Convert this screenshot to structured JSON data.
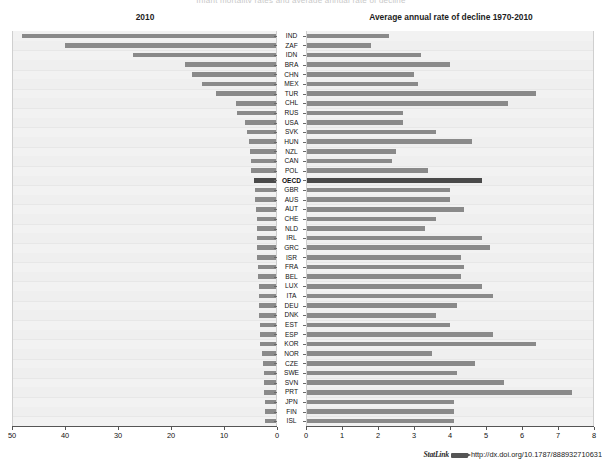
{
  "supertitle": "Infant mortality rates and average annual rate of decline",
  "panels": {
    "left": {
      "title": "2010",
      "axis_min": 0,
      "axis_max": 50,
      "reversed": true,
      "ticks": [
        50,
        40,
        30,
        20,
        10,
        0
      ]
    },
    "right": {
      "title": "Average  annual rate of decline 1970-2010",
      "axis_min": 0,
      "axis_max": 8,
      "reversed": false,
      "ticks": [
        0,
        1,
        2,
        3,
        4,
        5,
        6,
        7,
        8
      ]
    }
  },
  "highlight": {
    "category": "OECD",
    "color": "#4a4a4a"
  },
  "colors": {
    "bar": "#8a8a8a",
    "bar_highlight": "#4a4a4a",
    "plot_bg": "#f2f2f2",
    "grid": "#e7e7e7",
    "axis": "#555555"
  },
  "footer": {
    "statlink_label": "StatLink",
    "url": "http://dx.doi.org/10.1787/888932710631"
  },
  "chart_data": {
    "type": "bar",
    "title": "Infant mortality rates and average annual rate of decline",
    "orientation": "horizontal",
    "layout": "back-to-back dual panel (tornado)",
    "categories": [
      "IND",
      "ZAF",
      "IDN",
      "BRA",
      "CHN",
      "MEX",
      "TUR",
      "CHL",
      "RUS",
      "USA",
      "SVK",
      "HUN",
      "NZL",
      "CAN",
      "POL",
      "OECD",
      "GBR",
      "AUS",
      "AUT",
      "CHE",
      "NLD",
      "IRL",
      "GRC",
      "ISR",
      "FRA",
      "BEL",
      "LUX",
      "ITA",
      "DEU",
      "DNK",
      "EST",
      "ESP",
      "KOR",
      "NOR",
      "CZE",
      "SWE",
      "SVN",
      "PRT",
      "JPN",
      "FIN",
      "ISL"
    ],
    "series": [
      {
        "name": "2010",
        "panel": "left",
        "xlabel": "",
        "ylabel": "",
        "xlim": [
          50,
          0
        ],
        "values": [
          48.2,
          40.0,
          27.2,
          17.3,
          16.0,
          14.1,
          11.6,
          7.8,
          7.5,
          6.1,
          5.7,
          5.3,
          5.1,
          5.0,
          5.0,
          4.3,
          4.2,
          4.1,
          3.9,
          3.8,
          3.8,
          3.8,
          3.8,
          3.7,
          3.6,
          3.6,
          3.4,
          3.4,
          3.4,
          3.4,
          3.3,
          3.2,
          3.2,
          2.8,
          2.7,
          2.5,
          2.5,
          2.5,
          2.3,
          2.3,
          2.2
        ]
      },
      {
        "name": "Average annual rate of decline 1970-2010",
        "panel": "right",
        "xlabel": "",
        "ylabel": "",
        "xlim": [
          0,
          8
        ],
        "values": [
          2.3,
          1.8,
          3.2,
          4.0,
          3.0,
          3.1,
          6.4,
          5.6,
          2.7,
          2.7,
          3.6,
          4.6,
          2.5,
          2.4,
          3.4,
          4.9,
          4.0,
          4.0,
          4.4,
          3.6,
          3.3,
          4.9,
          5.1,
          4.3,
          4.4,
          4.3,
          4.9,
          5.2,
          4.2,
          3.6,
          4.0,
          5.2,
          6.4,
          3.5,
          4.7,
          4.2,
          5.5,
          7.4,
          4.1,
          4.1,
          4.1
        ]
      }
    ],
    "grid": "horizontal-faint",
    "legend": "none"
  }
}
